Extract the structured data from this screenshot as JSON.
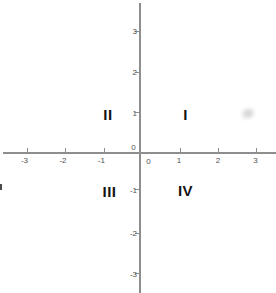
{
  "figure": {
    "type": "coordinate-plane",
    "colors": {
      "background": "#ffffff",
      "axis": "#8e8e8e",
      "tick_label": "#4f4f4f",
      "quadrant_label": "#141414"
    },
    "x_axis": {
      "tick_labels": [
        "-3",
        "-2",
        "-1",
        "1",
        "2",
        "3"
      ],
      "zero_label": "0"
    },
    "y_axis": {
      "tick_labels": [
        "3",
        "2",
        "1",
        "-1",
        "-2",
        "-3"
      ],
      "zero_label": "0"
    },
    "quadrants": {
      "q1": "I",
      "q2": "II",
      "q3": "III",
      "q4": "IV"
    }
  }
}
